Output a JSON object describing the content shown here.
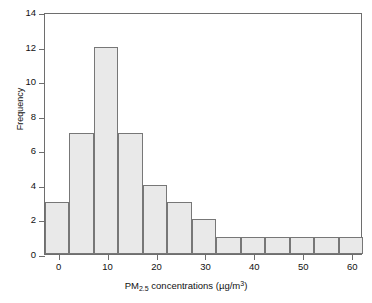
{
  "chart_data": {
    "type": "bar",
    "title": "",
    "subtitle": "",
    "xlabel_plain": "PM2.5 concentrations (µg/m³)",
    "xlabel_parts": {
      "prefix": "PM",
      "sub": "2.5",
      "middle": " concentrations (µg/m",
      "sup": "3",
      "suffix": ")"
    },
    "ylabel": "Frequency",
    "xlim": [
      -3,
      62
    ],
    "ylim": [
      0,
      14
    ],
    "xticks": [
      0,
      10,
      20,
      30,
      40,
      50,
      60
    ],
    "xtick_labels": [
      "0",
      "10",
      "20",
      "30",
      "40",
      "50",
      "60"
    ],
    "yticks": [
      0,
      2,
      4,
      6,
      8,
      10,
      12,
      14
    ],
    "ytick_labels": [
      "0",
      "2",
      "4",
      "6",
      "8",
      "10",
      "12",
      "14"
    ],
    "grid": false,
    "legend": false,
    "bin_width": 5,
    "bin_edges": [
      -3,
      2,
      7,
      12,
      17,
      22,
      27,
      32,
      37,
      42,
      47,
      52,
      57,
      62
    ],
    "categories": [
      "-3 to 2",
      "2 to 7",
      "7 to 12",
      "12 to 17",
      "17 to 22",
      "22 to 27",
      "27 to 32",
      "32 to 37",
      "37 to 42",
      "42 to 47",
      "47 to 52",
      "52 to 57",
      "57 to 62"
    ],
    "values": [
      3,
      7,
      12,
      7,
      4,
      3,
      2,
      1,
      1,
      1,
      1,
      1,
      1
    ],
    "bar_fill_color": "#e9e9e9",
    "bar_edge_color": "#777777",
    "axis_color": "#6e6e6e",
    "text_color": "#111111",
    "background_color": "#ffffff"
  }
}
